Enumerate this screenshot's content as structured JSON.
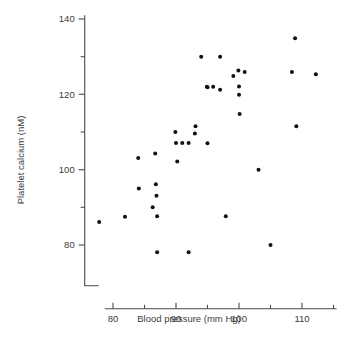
{
  "chart_data": {
    "type": "scatter",
    "title": "",
    "xlabel": "Blood pressure (mm Hg)",
    "ylabel": "Platelet calcium (nM)",
    "xlim": [
      75.5,
      115.5
    ],
    "ylim": [
      75.0,
      141.0
    ],
    "grid": false,
    "legend": null,
    "x_major_ticks": [
      80,
      90,
      100,
      110
    ],
    "x_minor_ticks": [
      85,
      95,
      105,
      115
    ],
    "x_major_tick_labels": [
      "80",
      "90",
      "100",
      "110"
    ],
    "y_major_ticks": [
      80,
      100,
      120,
      140
    ],
    "y_minor_ticks": [
      90,
      110,
      130
    ],
    "y_major_tick_labels": [
      "80",
      "100",
      "120",
      "140"
    ],
    "marker": "filled-circle",
    "marker_color": "#111111",
    "marker_size_px": 3.1,
    "n_points": 38,
    "points": [
      {
        "x": 77.8,
        "y": 86.1
      },
      {
        "x": 81.9,
        "y": 87.5
      },
      {
        "x": 84.0,
        "y": 103.1
      },
      {
        "x": 84.1,
        "y": 95.0
      },
      {
        "x": 86.7,
        "y": 104.3
      },
      {
        "x": 86.8,
        "y": 96.1
      },
      {
        "x": 86.9,
        "y": 93.1
      },
      {
        "x": 86.3,
        "y": 90.0
      },
      {
        "x": 87.0,
        "y": 87.6
      },
      {
        "x": 87.0,
        "y": 78.1
      },
      {
        "x": 89.9,
        "y": 110.0
      },
      {
        "x": 90.0,
        "y": 107.1
      },
      {
        "x": 90.2,
        "y": 102.2
      },
      {
        "x": 91.0,
        "y": 107.1
      },
      {
        "x": 92.0,
        "y": 107.1
      },
      {
        "x": 92.0,
        "y": 78.1
      },
      {
        "x": 93.1,
        "y": 111.5
      },
      {
        "x": 93.0,
        "y": 109.6
      },
      {
        "x": 94.0,
        "y": 130.0
      },
      {
        "x": 94.9,
        "y": 122.0
      },
      {
        "x": 95.0,
        "y": 107.0
      },
      {
        "x": 95.9,
        "y": 122.0
      },
      {
        "x": 97.0,
        "y": 130.0
      },
      {
        "x": 97.0,
        "y": 121.2
      },
      {
        "x": 97.9,
        "y": 87.6
      },
      {
        "x": 99.1,
        "y": 124.9
      },
      {
        "x": 99.9,
        "y": 126.3
      },
      {
        "x": 100.0,
        "y": 122.1
      },
      {
        "x": 100.0,
        "y": 119.9
      },
      {
        "x": 100.1,
        "y": 114.8
      },
      {
        "x": 100.9,
        "y": 125.9
      },
      {
        "x": 103.1,
        "y": 100.0
      },
      {
        "x": 105.0,
        "y": 80.0
      },
      {
        "x": 108.4,
        "y": 125.9
      },
      {
        "x": 108.9,
        "y": 134.9
      },
      {
        "x": 109.1,
        "y": 111.5
      },
      {
        "x": 112.2,
        "y": 125.3
      },
      {
        "x": 95.0,
        "y": 121.9
      }
    ]
  },
  "axes": {
    "x_axis_name": "blood-pressure-axis",
    "y_axis_name": "platelet-calcium-axis"
  }
}
